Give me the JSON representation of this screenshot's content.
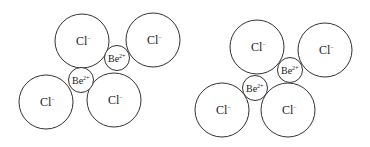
{
  "diagrams": [
    {
      "name": "left-structure",
      "ions": [
        {
          "type": "Cl",
          "label": "Cl",
          "charge": "−",
          "cx": 82,
          "cy": 41,
          "r": 27
        },
        {
          "type": "Cl",
          "label": "Cl",
          "charge": "−",
          "cx": 153,
          "cy": 40,
          "r": 27
        },
        {
          "type": "Cl",
          "label": "Cl",
          "charge": "−",
          "cx": 46,
          "cy": 102,
          "r": 27
        },
        {
          "type": "Cl",
          "label": "Cl",
          "charge": "−",
          "cx": 114,
          "cy": 100,
          "r": 27
        },
        {
          "type": "Be",
          "label": "Be",
          "charge": "2+",
          "cx": 117,
          "cy": 58,
          "r": 12.5
        },
        {
          "type": "Be",
          "label": "Be",
          "charge": "2+",
          "cx": 81,
          "cy": 80,
          "r": 12.5
        }
      ]
    },
    {
      "name": "right-structure",
      "ions": [
        {
          "type": "Cl",
          "label": "Cl",
          "charge": "−",
          "cx": 257,
          "cy": 47,
          "r": 27
        },
        {
          "type": "Cl",
          "label": "Cl",
          "charge": "−",
          "cx": 325,
          "cy": 50,
          "r": 27
        },
        {
          "type": "Cl",
          "label": "Cl",
          "charge": "−",
          "cx": 222,
          "cy": 110,
          "r": 27
        },
        {
          "type": "Cl",
          "label": "Cl",
          "charge": "−",
          "cx": 288,
          "cy": 110,
          "r": 27
        },
        {
          "type": "Be",
          "label": "Be",
          "charge": "2+",
          "cx": 290,
          "cy": 70,
          "r": 12.5
        },
        {
          "type": "Be",
          "label": "Be",
          "charge": "2+",
          "cx": 255,
          "cy": 88,
          "r": 12.5
        }
      ]
    }
  ],
  "colors": {
    "stroke": "#333333",
    "fill": "#ffffff",
    "text": "#222222"
  }
}
